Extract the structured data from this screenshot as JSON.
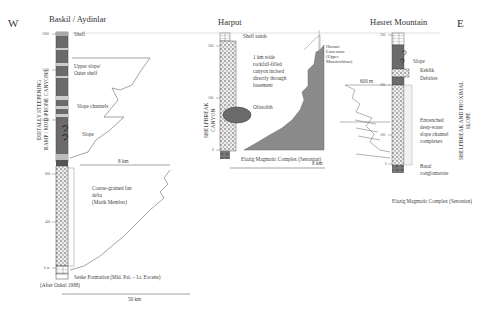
{
  "directions": {
    "west": "W",
    "east": "E"
  },
  "sections": [
    {
      "name": "Baskil / Aydinlar",
      "vertical_label": [
        "DISTALLY STEEPENING",
        "RAMP / MUD-PRONE CANYONS"
      ],
      "ticks": [
        "1800",
        "1400",
        "1200",
        "800",
        "400",
        "0 m"
      ],
      "labels": {
        "shelf": "Shelf",
        "upper_slope": "Upper slope/",
        "outer_shelf": "Outer shelf",
        "slope_channels": "Slope channels",
        "slope": "Slope",
        "fan_delta_1": "Coarse-grained fan",
        "fan_delta_2": "delta",
        "fan_delta_3": "(Marik Member)",
        "seske": "Seske Formation (Mid. Pal. – Lr. Eocene)",
        "source": "(After Ozkul 1988)"
      },
      "scale_8km": "8 km",
      "scale_50km": "50 km"
    },
    {
      "name": "Harput",
      "vertical_label": [
        "SHELFBREAK",
        "CANYON"
      ],
      "ticks": [
        "200",
        "100",
        "0"
      ],
      "labels": {
        "shelf_sands": "Shelf  sands",
        "canyon_1": "1 km wide",
        "canyon_2": "rockfall-filled",
        "canyon_3": "canyon incised",
        "canyon_4": "directly through",
        "canyon_5": "basement",
        "olistolith": "Olistolith",
        "harami_1": "Harami",
        "harami_2": "Limestone",
        "harami_3": "(Upper",
        "harami_4": "Maastrichtian)",
        "elazig": "Elazig Magmatic Complex (Senonian)"
      },
      "scale_8km": "8 km"
    },
    {
      "name": "Hasret Mountain",
      "vertical_label": [
        "SHELFBREAK AND PROXIMAL",
        "SLOPE"
      ],
      "ticks": [
        "300",
        "200",
        "100",
        "0"
      ],
      "labels": {
        "slope": "Slope",
        "keklik_1": "Keklik",
        "keklik_2": "Debrites",
        "distance": "600 m",
        "entrenched_1": "Entrenched",
        "entrenched_2": "deep-water",
        "entrenched_3": "slope channel",
        "entrenched_4": "complexes",
        "basal_1": "Basal",
        "basal_2": "conglomerate",
        "elazig": "Elazig Magmatic Complex (Senonian)"
      }
    }
  ],
  "colors": {
    "dark_fill": "#6b6b6b",
    "gray_fill": "#8a8a8a",
    "line": "#555555"
  }
}
